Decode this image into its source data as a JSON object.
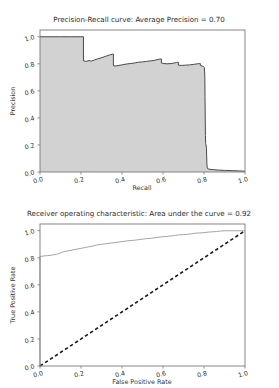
{
  "figures": [
    {
      "id": "precision-recall",
      "title": "Precision-Recall curve: Average Precision =    0.70",
      "xlabel": "Recall",
      "ylabel": "Precision",
      "xticks": [
        "0.0",
        "0.2",
        "0.4",
        "0.6",
        "0.8",
        "1.0"
      ],
      "yticks": [
        "0.0",
        "0.2",
        "0.4",
        "0.6",
        "0.8",
        "1.0"
      ]
    },
    {
      "id": "roc",
      "title": "Receiver operating characteristic:     Area under the curve = 0.92",
      "xlabel": "False Positive Rate",
      "ylabel": "True Positive Rate",
      "xticks": [
        "0.0",
        "0.2",
        "0.4",
        "0.6",
        "0.8",
        "1.0"
      ],
      "yticks": [
        "0.0",
        "0.2",
        "0.4",
        "0.6",
        "0.8",
        "1.0"
      ],
      "legend": [
        "ROC curve"
      ]
    }
  ],
  "chart_data": [
    {
      "type": "area",
      "title": "Precision-Recall curve: Average Precision =    0.70",
      "xlabel": "Recall",
      "ylabel": "Precision",
      "xlim": [
        0.0,
        1.0
      ],
      "ylim": [
        0.0,
        1.05
      ],
      "grid": false,
      "legend_position": "none",
      "annotations": [
        {
          "text": "Average Precision",
          "value": 0.7
        }
      ],
      "series": [
        {
          "name": "Precision-Recall curve",
          "fill_color": "#d2d2d2",
          "line_color": "#4a4a4a",
          "points": [
            [
              0.0,
              1.0
            ],
            [
              0.05,
              1.0
            ],
            [
              0.1,
              1.0
            ],
            [
              0.15,
              1.0
            ],
            [
              0.2,
              1.0
            ],
            [
              0.212,
              1.0
            ],
            [
              0.212,
              0.822
            ],
            [
              0.225,
              0.818
            ],
            [
              0.24,
              0.824
            ],
            [
              0.25,
              0.82
            ],
            [
              0.265,
              0.828
            ],
            [
              0.28,
              0.836
            ],
            [
              0.3,
              0.845
            ],
            [
              0.32,
              0.855
            ],
            [
              0.34,
              0.866
            ],
            [
              0.355,
              0.872
            ],
            [
              0.358,
              0.872
            ],
            [
              0.358,
              0.786
            ],
            [
              0.37,
              0.784
            ],
            [
              0.385,
              0.788
            ],
            [
              0.4,
              0.792
            ],
            [
              0.42,
              0.798
            ],
            [
              0.44,
              0.802
            ],
            [
              0.46,
              0.806
            ],
            [
              0.48,
              0.812
            ],
            [
              0.5,
              0.814
            ],
            [
              0.52,
              0.818
            ],
            [
              0.54,
              0.822
            ],
            [
              0.56,
              0.826
            ],
            [
              0.575,
              0.832
            ],
            [
              0.585,
              0.835
            ],
            [
              0.59,
              0.836
            ],
            [
              0.592,
              0.836
            ],
            [
              0.592,
              0.806
            ],
            [
              0.605,
              0.802
            ],
            [
              0.62,
              0.8
            ],
            [
              0.64,
              0.802
            ],
            [
              0.655,
              0.806
            ],
            [
              0.665,
              0.81
            ],
            [
              0.672,
              0.812
            ],
            [
              0.675,
              0.812
            ],
            [
              0.675,
              0.79
            ],
            [
              0.69,
              0.788
            ],
            [
              0.71,
              0.79
            ],
            [
              0.73,
              0.792
            ],
            [
              0.75,
              0.796
            ],
            [
              0.768,
              0.8
            ],
            [
              0.778,
              0.802
            ],
            [
              0.782,
              0.802
            ],
            [
              0.782,
              0.788
            ],
            [
              0.79,
              0.784
            ],
            [
              0.798,
              0.78
            ],
            [
              0.802,
              0.772
            ],
            [
              0.804,
              0.7
            ],
            [
              0.805,
              0.56
            ],
            [
              0.806,
              0.4
            ],
            [
              0.807,
              0.27
            ],
            [
              0.808,
              0.21
            ],
            [
              0.81,
              0.2
            ],
            [
              0.812,
              0.175
            ],
            [
              0.813,
              0.12
            ],
            [
              0.814,
              0.06
            ],
            [
              0.816,
              0.03
            ],
            [
              0.82,
              0.022
            ],
            [
              0.84,
              0.018
            ],
            [
              0.87,
              0.014
            ],
            [
              0.9,
              0.012
            ],
            [
              0.94,
              0.01
            ],
            [
              0.97,
              0.008
            ],
            [
              1.0,
              0.006
            ]
          ]
        }
      ]
    },
    {
      "type": "line",
      "title": "Receiver operating characteristic:     Area under the curve = 0.92",
      "xlabel": "False Positive Rate",
      "ylabel": "True Positive Rate",
      "xlim": [
        0.0,
        1.0
      ],
      "ylim": [
        0.0,
        1.05
      ],
      "grid": false,
      "legend_position": "lower right",
      "annotations": [
        {
          "text": "Area under the curve",
          "value": 0.92
        }
      ],
      "series": [
        {
          "name": "ROC curve",
          "line_color": "#9a9a9a",
          "style": "solid",
          "points": [
            [
              0.0,
              0.0
            ],
            [
              0.0,
              0.81
            ],
            [
              0.01,
              0.812
            ],
            [
              0.02,
              0.814
            ],
            [
              0.035,
              0.816
            ],
            [
              0.05,
              0.818
            ],
            [
              0.065,
              0.822
            ],
            [
              0.08,
              0.826
            ],
            [
              0.095,
              0.832
            ],
            [
              0.11,
              0.842
            ],
            [
              0.125,
              0.848
            ],
            [
              0.14,
              0.852
            ],
            [
              0.16,
              0.858
            ],
            [
              0.18,
              0.864
            ],
            [
              0.2,
              0.87
            ],
            [
              0.22,
              0.876
            ],
            [
              0.24,
              0.882
            ],
            [
              0.26,
              0.888
            ],
            [
              0.28,
              0.896
            ],
            [
              0.3,
              0.9
            ],
            [
              0.32,
              0.904
            ],
            [
              0.34,
              0.908
            ],
            [
              0.36,
              0.912
            ],
            [
              0.38,
              0.916
            ],
            [
              0.4,
              0.92
            ],
            [
              0.42,
              0.924
            ],
            [
              0.44,
              0.928
            ],
            [
              0.46,
              0.93
            ],
            [
              0.48,
              0.934
            ],
            [
              0.5,
              0.938
            ],
            [
              0.52,
              0.942
            ],
            [
              0.54,
              0.944
            ],
            [
              0.56,
              0.948
            ],
            [
              0.58,
              0.952
            ],
            [
              0.6,
              0.956
            ],
            [
              0.62,
              0.958
            ],
            [
              0.64,
              0.962
            ],
            [
              0.66,
              0.966
            ],
            [
              0.68,
              0.97
            ],
            [
              0.7,
              0.972
            ],
            [
              0.72,
              0.974
            ],
            [
              0.74,
              0.978
            ],
            [
              0.76,
              0.982
            ],
            [
              0.78,
              0.984
            ],
            [
              0.8,
              0.986
            ],
            [
              0.82,
              0.99
            ],
            [
              0.84,
              0.992
            ],
            [
              0.86,
              0.994
            ],
            [
              0.88,
              0.998
            ],
            [
              0.9,
              1.0
            ],
            [
              0.92,
              1.0
            ],
            [
              0.95,
              1.0
            ],
            [
              0.975,
              1.0
            ],
            [
              1.0,
              1.0
            ]
          ]
        },
        {
          "name": "chance-diagonal",
          "line_color": "#1a1a1a",
          "style": "dashed",
          "points": [
            [
              0.0,
              0.0
            ],
            [
              1.0,
              1.0
            ]
          ]
        }
      ]
    }
  ]
}
